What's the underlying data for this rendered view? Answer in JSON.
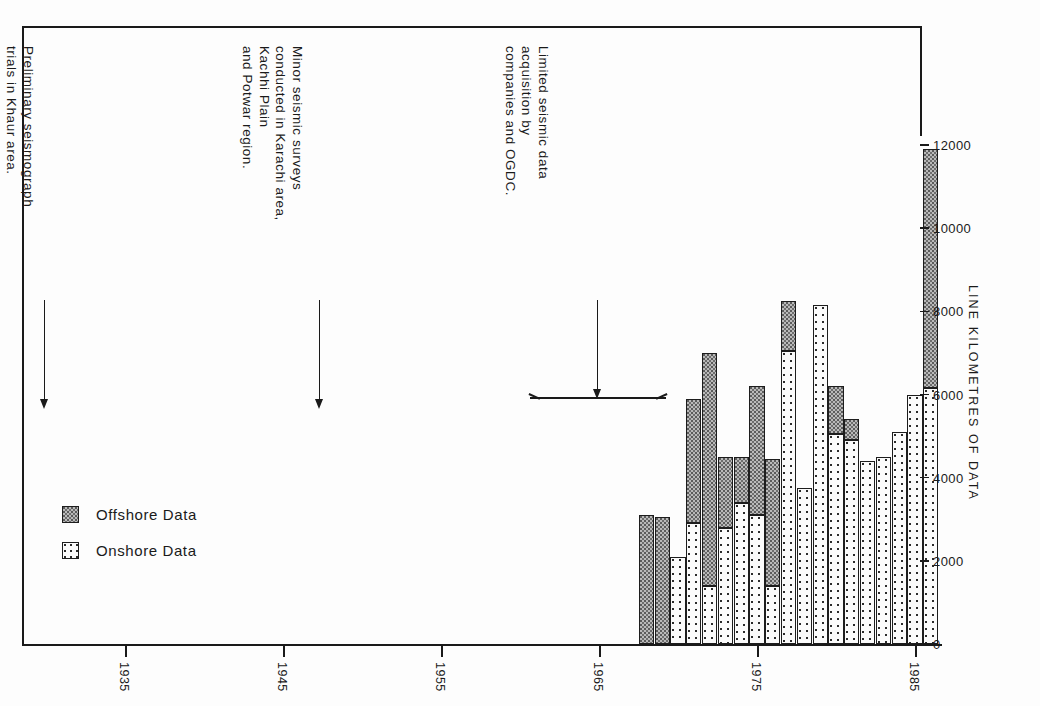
{
  "chart_data": {
    "type": "bar",
    "title": "",
    "subtitle": "",
    "xlabel": "",
    "ylabel": "LINE KILOMETRES OF DATA",
    "stacked": true,
    "grid": false,
    "legend_position": "inside-left",
    "xlim": [
      1930,
      1988
    ],
    "ylim": [
      0,
      12600
    ],
    "yticks": [
      0,
      2000,
      4000,
      6000,
      8000,
      10000,
      12000
    ],
    "ytick_labels": [
      "0",
      "2000",
      "4000",
      "6000",
      "8000",
      "10000",
      "12000"
    ],
    "xticks": [
      1935,
      1945,
      1955,
      1965,
      1975,
      1985
    ],
    "xtick_labels": [
      "1935",
      "1945",
      "1955",
      "1965",
      "1975",
      "1985"
    ],
    "categories": [
      1968,
      1969,
      1970,
      1971,
      1972,
      1973,
      1974,
      1975,
      1976,
      1977,
      1978,
      1979,
      1980,
      1981,
      1982,
      1983,
      1984,
      1985,
      1986
    ],
    "series": [
      {
        "name": "Onshore Data",
        "values": [
          0,
          0,
          2100,
          2900,
          1400,
          2800,
          3400,
          3100,
          1400,
          7050,
          3750,
          8150,
          5050,
          4900,
          4400,
          4500,
          5100,
          6000,
          6150
        ]
      },
      {
        "name": "Offshore Data",
        "values": [
          3100,
          3050,
          0,
          3000,
          5600,
          1700,
          1100,
          3100,
          3050,
          1200,
          0,
          0,
          1150,
          500,
          0,
          0,
          0,
          0,
          5750
        ]
      }
    ],
    "totals": [
      3100,
      3050,
      2100,
      5900,
      7000,
      4500,
      4500,
      6200,
      4450,
      8250,
      3750,
      8150,
      6200,
      5400,
      4400,
      4500,
      5100,
      6000,
      11900
    ]
  },
  "legend": {
    "items": [
      {
        "label": "Offshore Data",
        "swatch": "offshore-swatch"
      },
      {
        "label": "Onshore Data",
        "swatch": "onshore-swatch"
      }
    ]
  },
  "annotations": [
    {
      "id": "preliminary-trials",
      "lines": [
        "Preliminary seismograph",
        "trials in Khaur area."
      ]
    },
    {
      "id": "minor-surveys",
      "lines": [
        "Minor seismic surveys",
        "conducted in Karachi area,",
        "Kachhi Plain",
        "and Potwar region."
      ]
    },
    {
      "id": "limited-acquisition",
      "lines": [
        "Limited seismic data",
        "acquisition by",
        "companies and OGDC."
      ]
    }
  ],
  "colors": {
    "offshore": "#b9b9b9",
    "onshore": "#fbfbfb",
    "ink": "#1a1a1a",
    "background": "#ffffff"
  }
}
